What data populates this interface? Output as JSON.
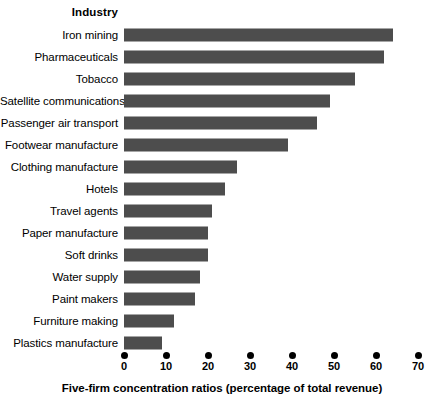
{
  "header": {
    "column_label": "Industry"
  },
  "axis": {
    "title": "Five-firm concentration ratios (percentage of total revenue)",
    "ticks": [
      "0",
      "10",
      "20",
      "30",
      "40",
      "50",
      "60",
      "70"
    ]
  },
  "style": {
    "bar_color": "#4d4d4d",
    "background": "#ffffff",
    "text_color": "#000000"
  },
  "chart_data": {
    "type": "bar",
    "orientation": "horizontal",
    "title": "",
    "subtitle": "",
    "xlabel": "Five-firm concentration ratios (percentage of total revenue)",
    "ylabel": "Industry",
    "xlim": [
      0,
      70
    ],
    "xticks": [
      0,
      10,
      20,
      30,
      40,
      50,
      60,
      70
    ],
    "grid": false,
    "legend": false,
    "categories": [
      "Iron mining",
      "Pharmaceuticals",
      "Tobacco",
      "Satellite communications",
      "Passenger air transport",
      "Footwear manufacture",
      "Clothing manufacture",
      "Hotels",
      "Travel agents",
      "Paper manufacture",
      "Soft drinks",
      "Water supply",
      "Paint makers",
      "Furniture making",
      "Plastics manufacture"
    ],
    "values": [
      64,
      62,
      55,
      49,
      46,
      39,
      27,
      24,
      21,
      20,
      20,
      18,
      17,
      12,
      9
    ],
    "series": [
      {
        "name": "Five-firm concentration ratio",
        "values": [
          64,
          62,
          55,
          49,
          46,
          39,
          27,
          24,
          21,
          20,
          20,
          18,
          17,
          12,
          9
        ]
      }
    ]
  }
}
